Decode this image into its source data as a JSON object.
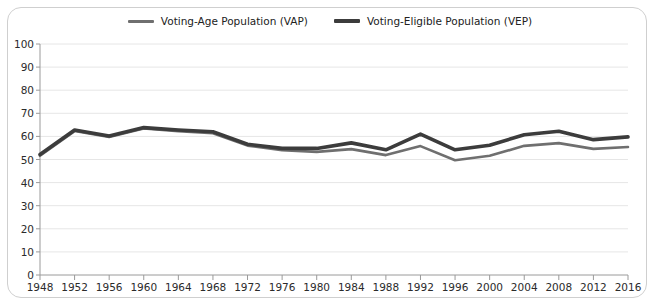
{
  "chart_data": {
    "type": "line",
    "title": "",
    "xlabel": "",
    "ylabel": "",
    "ylim": [
      0,
      100
    ],
    "ytick_step": 10,
    "grid": true,
    "legend_position": "top",
    "categories": [
      1948,
      1952,
      1956,
      1960,
      1964,
      1968,
      1972,
      1976,
      1980,
      1984,
      1988,
      1992,
      1996,
      2000,
      2004,
      2008,
      2012,
      2016
    ],
    "yticks": [
      0,
      10,
      20,
      30,
      40,
      50,
      60,
      70,
      80,
      90,
      100
    ],
    "series": [
      {
        "name": "Voting-Age Population (VAP)",
        "color": "#6f6f6f",
        "width": 2.6,
        "values": [
          51.6,
          62.3,
          59.8,
          63.4,
          62.3,
          61.4,
          56.0,
          54.0,
          53.3,
          54.5,
          51.9,
          55.8,
          49.7,
          51.6,
          55.9,
          57.1,
          54.6,
          55.4
        ]
      },
      {
        "name": "Voting-Eligible Population (VEP)",
        "color": "#3c3c3c",
        "width": 3.6,
        "values": [
          52.2,
          62.8,
          60.2,
          63.8,
          62.8,
          62.0,
          56.6,
          54.8,
          54.8,
          57.2,
          54.2,
          61.0,
          54.2,
          56.2,
          60.7,
          62.2,
          58.6,
          59.8
        ]
      }
    ]
  },
  "legend": [
    {
      "label": "Voting-Age Population (VAP)",
      "icon": "line-swatch"
    },
    {
      "label": "Voting-Eligible Population (VEP)",
      "icon": "line-swatch"
    }
  ],
  "colors": {
    "vap": "#6f6f6f",
    "vep": "#3c3c3c",
    "grid": "#e6e6e6",
    "axis": "#9a9a9a",
    "frame": "#cfcfcf",
    "text": "#2b2b2b",
    "background": "#ffffff"
  }
}
